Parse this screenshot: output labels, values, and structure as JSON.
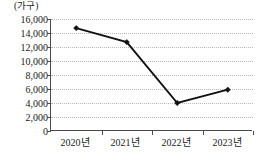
{
  "chart_data": {
    "type": "line",
    "title": "",
    "subtitle": "",
    "xlabel": "",
    "ylabel": "",
    "unit_label": "(가구)",
    "categories": [
      "2020년",
      "2021년",
      "2022년",
      "2023년"
    ],
    "values": [
      14700,
      12700,
      4000,
      5900
    ],
    "series": [
      {
        "name": "",
        "values": [
          14700,
          12700,
          4000,
          5900
        ]
      }
    ],
    "ylim": [
      0,
      16000
    ],
    "ytick_step": 2000,
    "ytick_labels": [
      "16,000",
      "14,000",
      "12,000",
      "10,000",
      "8,000",
      "6,000",
      "4,000",
      "2,000",
      "0"
    ],
    "ytick_values": [
      16000,
      14000,
      12000,
      10000,
      8000,
      6000,
      4000,
      2000,
      0
    ],
    "grid": true,
    "grid_orientation": "horizontal",
    "grid_style": "dotted",
    "legend": false,
    "legend_position": "none",
    "marker": "diamond",
    "colors": {
      "line": "#111111",
      "marker": "#111111",
      "grid": "#b8b8b8",
      "axis": "#4a4a4a",
      "text": "#1a1a1a",
      "background": "#ffffff"
    }
  }
}
